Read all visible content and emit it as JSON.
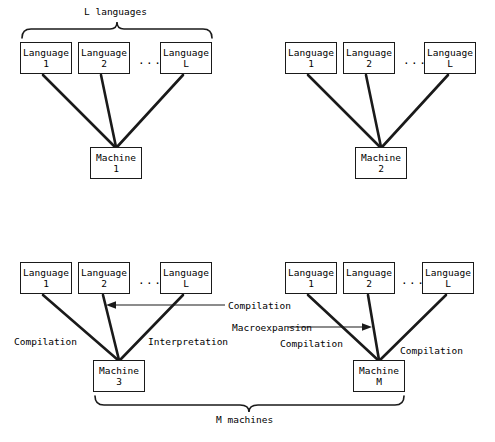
{
  "figure": {
    "type": "diagram",
    "top_brace_label": "L languages",
    "bottom_brace_label": "M machines"
  },
  "panels": [
    {
      "id": "panel-top-left",
      "languages": [
        {
          "line1": "Language",
          "line2": "1"
        },
        {
          "line1": "Language",
          "line2": "2"
        },
        {
          "line1": "Language",
          "line2": "L"
        }
      ],
      "ellipsis": "...",
      "machine": {
        "line1": "Machine",
        "line2": "1"
      },
      "edge_labels": []
    },
    {
      "id": "panel-top-right",
      "languages": [
        {
          "line1": "Language",
          "line2": "1"
        },
        {
          "line1": "Language",
          "line2": "2"
        },
        {
          "line1": "Language",
          "line2": "L"
        }
      ],
      "ellipsis": "...",
      "machine": {
        "line1": "Machine",
        "line2": "2"
      },
      "edge_labels": []
    },
    {
      "id": "panel-bottom-left",
      "languages": [
        {
          "line1": "Language",
          "line2": "1"
        },
        {
          "line1": "Language",
          "line2": "2"
        },
        {
          "line1": "Language",
          "line2": "L"
        }
      ],
      "ellipsis": "...",
      "machine": {
        "line1": "Machine",
        "line2": "3"
      },
      "edge_labels": [
        {
          "text": "Compilation",
          "role": "left-edge"
        },
        {
          "text": "Interpretation",
          "role": "right-edge"
        },
        {
          "text": "Compilation",
          "role": "callout-middle"
        }
      ]
    },
    {
      "id": "panel-bottom-right",
      "languages": [
        {
          "line1": "Language",
          "line2": "1"
        },
        {
          "line1": "Language",
          "line2": "2"
        },
        {
          "line1": "Language",
          "line2": "L"
        }
      ],
      "ellipsis": "...",
      "machine": {
        "line1": "Machine",
        "line2": "M"
      },
      "edge_labels": [
        {
          "text": "Macroexpansion",
          "role": "callout-middle"
        },
        {
          "text": "Compilation",
          "role": "left-edge"
        },
        {
          "text": "Compilation",
          "role": "right-edge"
        }
      ]
    }
  ],
  "colors": {
    "stroke": "#1a1a1a",
    "background": "#ffffff",
    "text": "#000000"
  }
}
